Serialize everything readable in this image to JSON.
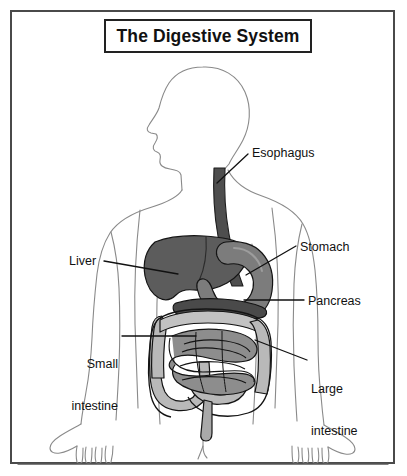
{
  "figure": {
    "title": "The Digestive System",
    "kind": "anatomical-diagram",
    "view": "anterior body silhouette, head in left profile",
    "frame_border_color": "#4a4a4a",
    "background_color": "#ffffff",
    "line_color": "#111111"
  },
  "labels": {
    "esophagus": "Esophagus",
    "stomach": "Stomach",
    "pancreas": "Pancreas",
    "large_intestine_line1": "Large",
    "large_intestine_line2": "intestine",
    "liver": "Liver",
    "small_intestine_line1": "Small",
    "small_intestine_line2": "intestine"
  },
  "organs": [
    {
      "name": "esophagus",
      "label": "Esophagus",
      "fill": "#4e4e4e"
    },
    {
      "name": "stomach",
      "label": "Stomach",
      "fill": "#7c7c7c"
    },
    {
      "name": "liver",
      "label": "Liver",
      "fill": "#5c5c5c"
    },
    {
      "name": "pancreas",
      "label": "Pancreas",
      "fill": "#4a4a4a"
    },
    {
      "name": "large-intestine",
      "label": "Large intestine",
      "fill": "#b9b9b9"
    },
    {
      "name": "small-intestine",
      "label": "Small intestine",
      "fill": "#8d8d8d"
    }
  ],
  "colors": {
    "body_outline": "#8a8a8a",
    "organ_outline": "#111111",
    "leader_line": "#111111",
    "esophagus": "#4e4e4e",
    "stomach": "#7c7c7c",
    "liver": "#5c5c5c",
    "pancreas": "#4a4a4a",
    "large_intestine": "#b9b9b9",
    "small_intestine": "#8d8d8d",
    "title_border": "#222222"
  }
}
